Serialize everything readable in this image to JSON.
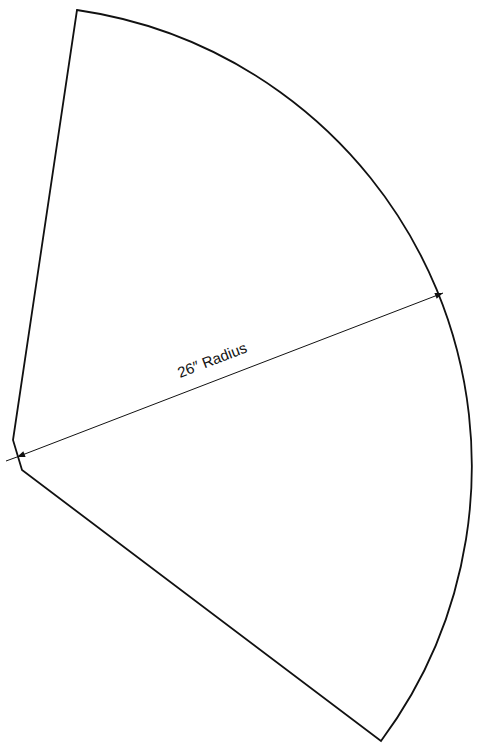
{
  "diagram": {
    "title": "",
    "shape": "sector-pattern",
    "dimension": {
      "label": "26″ Radius",
      "value": 26,
      "unit": "inch"
    },
    "colors": {
      "stroke": "#111111",
      "background": "#ffffff"
    }
  }
}
